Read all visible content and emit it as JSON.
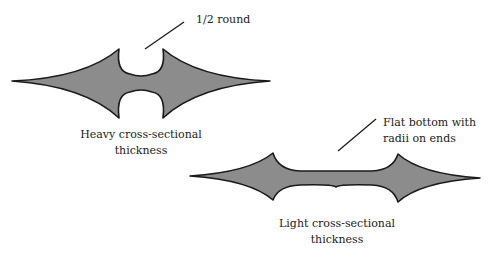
{
  "colors": {
    "fill": "#8c8c8c",
    "outline": "#1a1a1a",
    "text": "#222222",
    "background": "#ffffff"
  },
  "heavy": {
    "callout": "1/2 round",
    "caption_line1": "Heavy cross-sectional",
    "caption_line2": "thickness"
  },
  "light": {
    "callout_line1": "Flat bottom with",
    "callout_line2": "radii on ends",
    "caption_line1": "Light cross-sectional",
    "caption_line2": "thickness"
  }
}
